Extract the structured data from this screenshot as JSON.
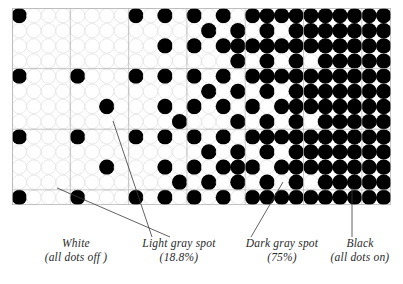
{
  "figure": {
    "kind": "halftone-dot-gradient-diagram",
    "grid": {
      "columns": 26,
      "rows": 13,
      "cell_columns": 7,
      "cell_rows": 3,
      "dots_per_cell_x": 4,
      "dots_per_cell_y": 4,
      "dot_on_color": "#000000",
      "dot_off_fill": "#ffffff",
      "dot_off_stroke": "#e2e2e2",
      "cell_line_color": "#b0b0b0",
      "background": "#ffffff"
    },
    "gradient": {
      "description": "left-to-right halftone ramp from 0% to 100% coverage",
      "column_coverage_percent": [
        0,
        0,
        2,
        4,
        6,
        6,
        8,
        10,
        14,
        19,
        25,
        31,
        38,
        44,
        50,
        56,
        63,
        69,
        75,
        81,
        86,
        90,
        94,
        97,
        100,
        100
      ]
    }
  },
  "chart_data": {
    "type": "heatmap",
    "title": "",
    "xlabel": "",
    "ylabel": "",
    "legend_position": "bottom",
    "grid": true,
    "categories": [
      "White",
      "Light gray spot",
      "Dark gray spot",
      "Black"
    ],
    "values": [
      0,
      18.8,
      75,
      100
    ]
  },
  "labels": [
    {
      "id": "white",
      "title": "White",
      "subtitle": "(all dots off )",
      "tone_percent": "0%",
      "leader": {
        "x1": 170,
        "y1": 237,
        "x2": 57,
        "y2": 188
      }
    },
    {
      "id": "light-gray",
      "title": "Light gray spot",
      "subtitle": "(18.8%)",
      "tone_percent": "18.8%",
      "leader": {
        "x1": 152,
        "y1": 237,
        "x2": 113,
        "y2": 121
      }
    },
    {
      "id": "dark-gray",
      "title": "Dark gray spot",
      "subtitle": "(75%)",
      "tone_percent": "75%",
      "leader": {
        "x1": 251,
        "y1": 237,
        "x2": 283,
        "y2": 182
      }
    },
    {
      "id": "black",
      "title": "Black",
      "subtitle": "(all dots on)",
      "tone_percent": "100%",
      "leader": {
        "x1": 352,
        "y1": 237,
        "x2": 352,
        "y2": 188
      }
    }
  ]
}
